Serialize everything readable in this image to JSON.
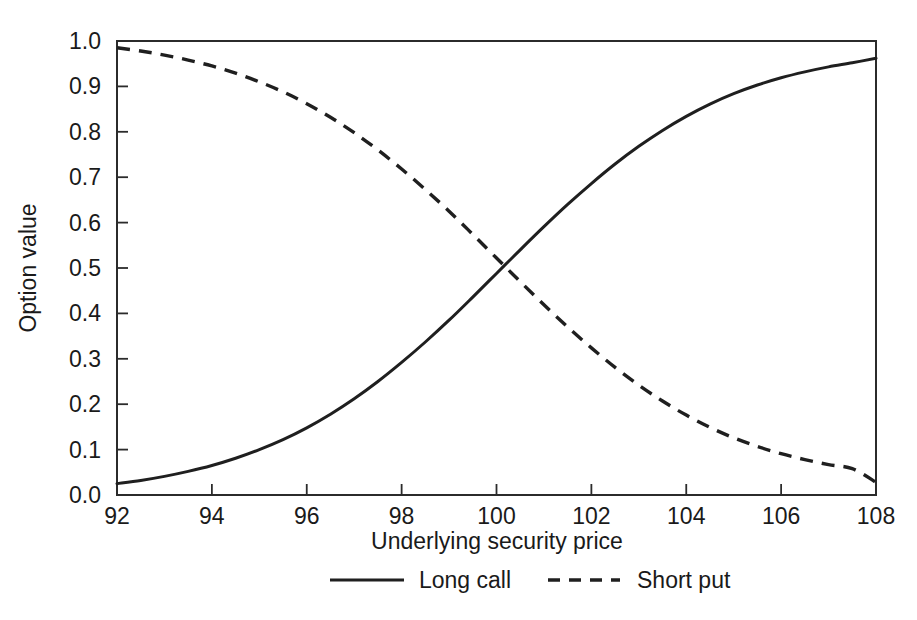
{
  "chart_data": {
    "type": "line",
    "title": "",
    "subtitle": "",
    "xlabel": "Underlying security price",
    "ylabel": "Option value",
    "xlim": [
      92,
      108
    ],
    "ylim": [
      0.0,
      1.0
    ],
    "grid": false,
    "legend_position": "bottom-center",
    "xticks": [
      92,
      94,
      96,
      98,
      100,
      102,
      104,
      106,
      108
    ],
    "xtick_labels": [
      "92",
      "94",
      "96",
      "98",
      "100",
      "102",
      "104",
      "106",
      "108"
    ],
    "yticks": [
      0.0,
      0.1,
      0.2,
      0.3,
      0.4,
      0.5,
      0.6,
      0.7,
      0.8,
      0.9,
      1.0
    ],
    "ytick_labels": [
      "0.0",
      "0.1",
      "0.2",
      "0.3",
      "0.4",
      "0.5",
      "0.6",
      "0.7",
      "0.8",
      "0.9",
      "1.0"
    ],
    "x": [
      92,
      92.5,
      93,
      93.5,
      94,
      94.5,
      95,
      95.5,
      96,
      96.5,
      97,
      97.5,
      98,
      98.5,
      99,
      99.5,
      100,
      100.5,
      101,
      101.5,
      102,
      102.5,
      103,
      103.5,
      104,
      104.5,
      105,
      105.5,
      106,
      106.5,
      107,
      107.5,
      108
    ],
    "series": [
      {
        "name": "Long call",
        "style": "solid",
        "color": "#1f1f1f",
        "values": [
          0.025,
          0.032,
          0.041,
          0.052,
          0.065,
          0.081,
          0.1,
          0.122,
          0.148,
          0.178,
          0.212,
          0.25,
          0.292,
          0.337,
          0.385,
          0.436,
          0.488,
          0.54,
          0.591,
          0.64,
          0.686,
          0.729,
          0.768,
          0.803,
          0.834,
          0.861,
          0.884,
          0.903,
          0.919,
          0.932,
          0.943,
          0.952,
          0.962
        ]
      },
      {
        "name": "Short put",
        "style": "dashed",
        "color": "#1f1f1f",
        "values": [
          0.985,
          0.978,
          0.969,
          0.958,
          0.945,
          0.929,
          0.91,
          0.888,
          0.862,
          0.832,
          0.798,
          0.76,
          0.718,
          0.673,
          0.625,
          0.574,
          0.522,
          0.47,
          0.419,
          0.37,
          0.324,
          0.281,
          0.242,
          0.207,
          0.176,
          0.149,
          0.126,
          0.107,
          0.091,
          0.078,
          0.067,
          0.058,
          0.028
        ]
      }
    ],
    "legend": [
      {
        "label": "Long call",
        "style": "solid"
      },
      {
        "label": "Short put",
        "style": "dashed"
      }
    ]
  }
}
